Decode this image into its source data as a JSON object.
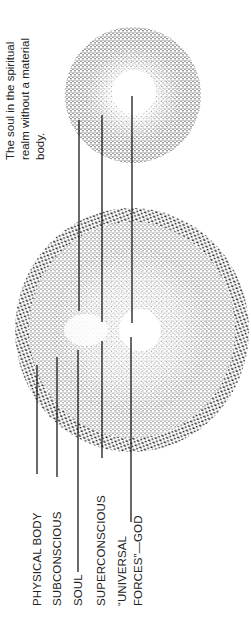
{
  "caption": {
    "lines": [
      "The soul in the spiritual",
      "realm without a material",
      "body."
    ]
  },
  "labels": {
    "physical_body": "PHYSICAL BODY",
    "subconscious": "SUBCONSCIOUS",
    "soul": "SOUL",
    "superconscious": "SUPERCONSCIOUS",
    "universal_line1": "“UNIVERSAL",
    "universal_line2": "FORCES”—GOD"
  },
  "colors": {
    "ink": "#1a1a1a",
    "background": "#ffffff"
  }
}
